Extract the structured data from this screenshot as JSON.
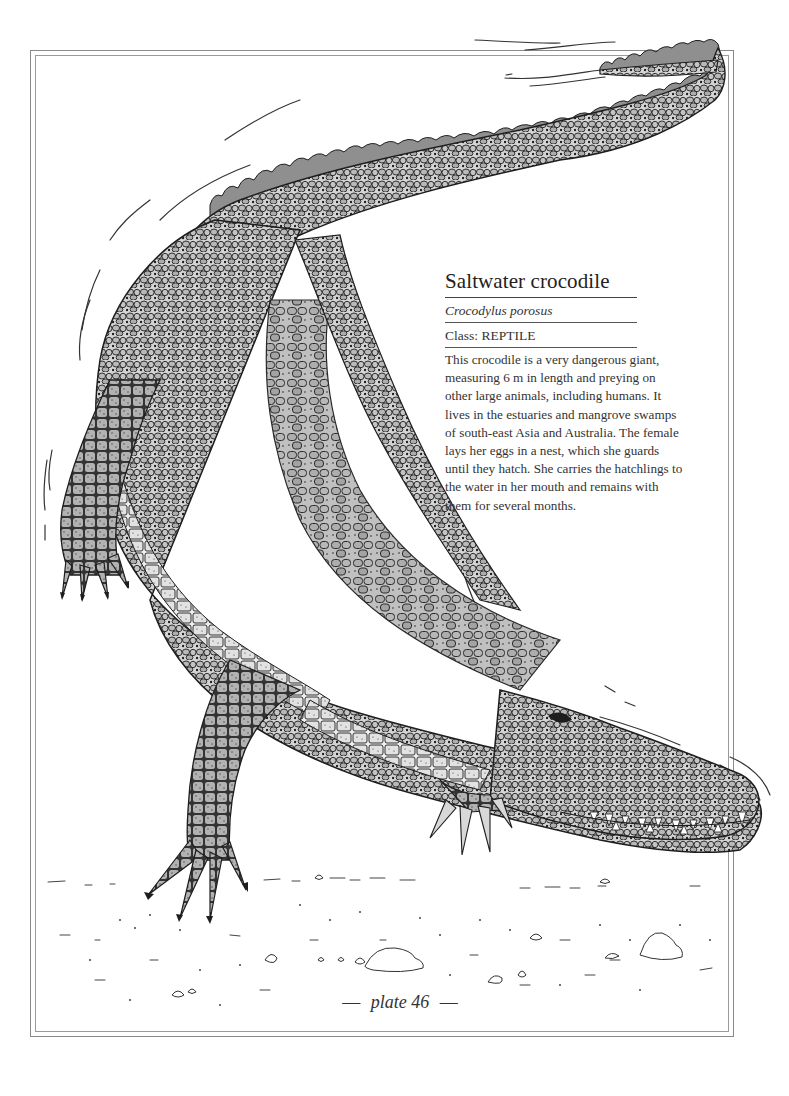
{
  "plate": {
    "title": "Saltwater crocodile",
    "scientific_name": "Crocodylus porosus",
    "class_label": "Class: REPTILE",
    "description": "This crocodile is a very dangerous giant, measuring 6 m in length and preying on other large animals, including humans. It lives in the estuaries and mangrove swamps of south-east Asia and Australia. The female lays her eggs in a nest, which she guards until they hatch. She carries the hatchlings to the water in her mouth and remains with them for several months.",
    "footer": {
      "dash_left": "—",
      "label": "plate 46",
      "dash_right": "—"
    }
  },
  "illustration": {
    "subject": "crocodile-illustration",
    "colors": {
      "ink": "#1e1e1e",
      "scale_fill": "#c9c9c9",
      "scale_dark": "#9e9e9e",
      "frame": "#8a8a8a"
    }
  }
}
